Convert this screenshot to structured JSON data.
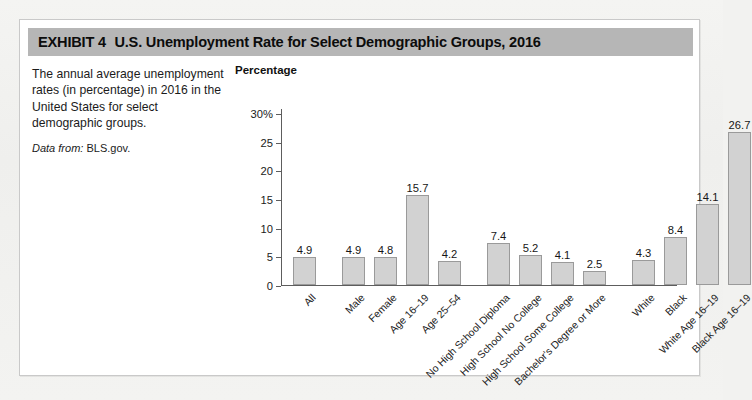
{
  "exhibit": {
    "label": "EXHIBIT 4",
    "title": "U.S. Unemployment Rate for Select Demographic Groups, 2016"
  },
  "description": {
    "body": "The annual average unemployment rates (in percentage) in 2016 in the United States for select demographic groups.",
    "source_label": "Data from:",
    "source_value": "BLS.gov."
  },
  "chart_data": {
    "type": "bar",
    "title": "U.S. Unemployment Rate for Select Demographic Groups, 2016",
    "xlabel": "",
    "ylabel": "Percentage",
    "ylim": [
      0,
      30
    ],
    "yticks": [
      "0",
      "5",
      "10",
      "15",
      "20",
      "25",
      "30%"
    ],
    "ytick_values": [
      0,
      5,
      10,
      15,
      20,
      25,
      30
    ],
    "grid": false,
    "legend": "none",
    "bar_color": "#d2d2d2",
    "bar_border_color": "#9a9a9a",
    "axis_color": "#5d5d5d",
    "categories": [
      "All",
      "Male",
      "Female",
      "Age 16–19",
      "Age 25–54",
      "No High School Diploma",
      "High School No College",
      "High School Some College",
      "Bachelor's Degree or More",
      "White",
      "Black",
      "White Age 16–19",
      "Black Age 16–19"
    ],
    "values": [
      4.9,
      4.9,
      4.8,
      15.7,
      4.2,
      7.4,
      5.2,
      4.1,
      2.5,
      4.3,
      8.4,
      14.1,
      26.7
    ],
    "value_labels": [
      "4.9",
      "4.9",
      "4.8",
      "15.7",
      "4.2",
      "7.4",
      "5.2",
      "4.1",
      "2.5",
      "4.3",
      "8.4",
      "14.1",
      "26.7"
    ],
    "groups": [
      {
        "name": "overall",
        "indices": [
          0
        ]
      },
      {
        "name": "sex-and-age",
        "indices": [
          1,
          2,
          3,
          4
        ]
      },
      {
        "name": "education",
        "indices": [
          5,
          6,
          7,
          8
        ]
      },
      {
        "name": "race-and-age",
        "indices": [
          9,
          10,
          11,
          12
        ]
      }
    ]
  }
}
